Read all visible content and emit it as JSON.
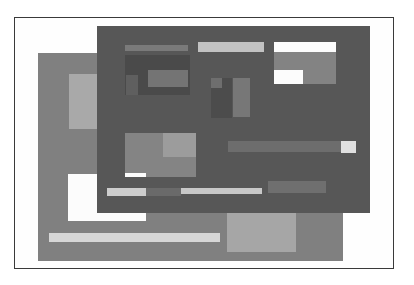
{
  "illustration": {
    "title": "Abstract overlapping windows",
    "colors": {
      "frame_border": "#3a3a3a",
      "back_window": "#7f7f7f",
      "front_window": "#575757",
      "light": "#b4b4b4",
      "lighter": "#d2d2d2",
      "white": "#fcfcfc",
      "mid": "#8a8a8a",
      "dark_region": "#4a4a4a"
    }
  }
}
